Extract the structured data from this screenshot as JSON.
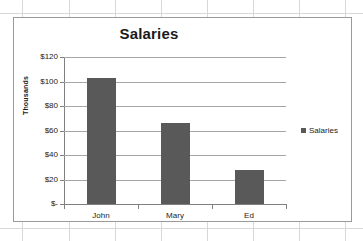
{
  "chart_data": {
    "type": "bar",
    "title": "Salaries",
    "categories": [
      "John",
      "Mary",
      "Ed"
    ],
    "values": [
      103,
      66,
      28
    ],
    "series": [
      {
        "name": "Salaries",
        "values": [
          103,
          66,
          28
        ]
      }
    ],
    "xlabel": "",
    "ylabel": "Thousands",
    "ylim": [
      0,
      120
    ],
    "ytick_labels": [
      "$120",
      "$100",
      "$80",
      "$60",
      "$40",
      "$20",
      "$-"
    ],
    "ytick_values": [
      120,
      100,
      80,
      60,
      40,
      20,
      0
    ],
    "grid": true,
    "legend": {
      "position": "right",
      "entries": [
        "Salaries"
      ]
    },
    "colors": {
      "bar": "#595959",
      "gridline": "#a6a6a6",
      "axis": "#808080",
      "text": "#1a1a1a",
      "plot_background": "#ffffff",
      "frame_border": "#9a9a9a",
      "sheet_gridline": "#d8d8d8"
    }
  }
}
